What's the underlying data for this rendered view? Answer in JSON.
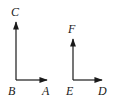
{
  "figure_left": {
    "labels": {
      "top": "C",
      "corner": "B",
      "right": "A"
    }
  },
  "figure_right": {
    "labels": {
      "top": "F",
      "corner": "E",
      "right": "D"
    }
  },
  "colors": {
    "stroke": "#1a1a1a",
    "background": "#ffffff"
  }
}
